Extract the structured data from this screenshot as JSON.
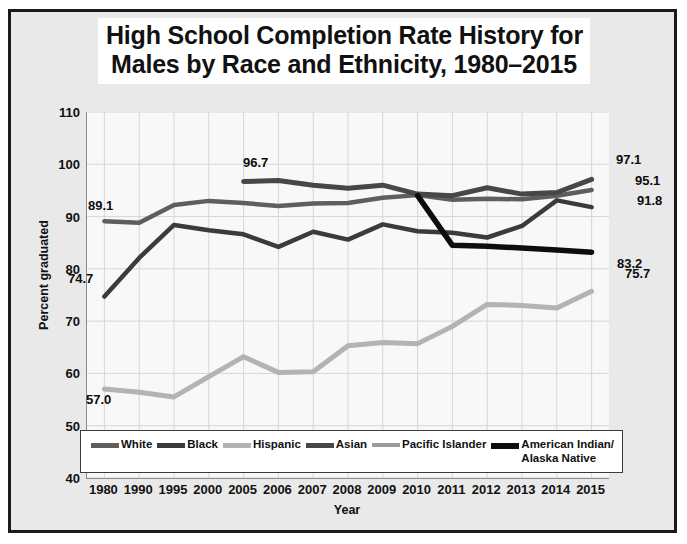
{
  "title": {
    "line1": "High School Completion Rate History for",
    "line2": "Males by Race and Ethnicity, 1980–2015"
  },
  "axes": {
    "ylabel": "Percent graduated",
    "xlabel": "Year",
    "yticks": [
      "110",
      "100",
      "90",
      "80",
      "70",
      "60",
      "50",
      "40"
    ],
    "ylim_min": 40,
    "ylim_max": 110
  },
  "colors": {
    "white_series": "#5e5e5e",
    "black_series": "#3b3b3b",
    "hispanic_series": "#b3b3b3",
    "asian_series": "#474747",
    "pacific_islander_series": "#9c9c9c",
    "american_indian_series": "#0d0d0d",
    "frame": "#1a1a1a",
    "canvas": "#e9e9e9",
    "plot_bg": "#f8f8f8",
    "grid": "#d6d6d6"
  },
  "legend": {
    "items": [
      {
        "label": "White",
        "label2": ""
      },
      {
        "label": "Black",
        "label2": ""
      },
      {
        "label": "Hispanic",
        "label2": ""
      },
      {
        "label": "Asian",
        "label2": ""
      },
      {
        "label": "Pacific Islander",
        "label2": ""
      },
      {
        "label": "American Indian/",
        "label2": "Alaska Native"
      }
    ]
  },
  "annotations": [
    {
      "text": "89.1",
      "x": 88,
      "y": 198
    },
    {
      "text": "74.7",
      "x": 68,
      "y": 271
    },
    {
      "text": "57.0",
      "x": 86,
      "y": 392
    },
    {
      "text": "96.7",
      "x": 243,
      "y": 155
    },
    {
      "text": "97.1",
      "x": 616,
      "y": 152
    },
    {
      "text": "95.1",
      "x": 635,
      "y": 173
    },
    {
      "text": "91.8",
      "x": 637,
      "y": 193
    },
    {
      "text": "83.2",
      "x": 617,
      "y": 256
    },
    {
      "text": "75.7",
      "x": 625,
      "y": 266
    }
  ],
  "chart_data": {
    "type": "line",
    "title": "High School Completion Rate History for Males by Race and Ethnicity, 1980–2015",
    "xlabel": "Year",
    "ylabel": "Percent graduated",
    "ylim": [
      40,
      110
    ],
    "grid": true,
    "legend_position": "inside-bottom",
    "categories": [
      "1980",
      "1990",
      "1995",
      "2000",
      "2005",
      "2006",
      "2007",
      "2008",
      "2009",
      "2010",
      "2011",
      "2012",
      "2013",
      "2014",
      "2015"
    ],
    "series": [
      {
        "name": "White",
        "color": "#5e5e5e",
        "values": [
          89.1,
          88.8,
          92.2,
          93.0,
          92.6,
          92.0,
          92.5,
          92.6,
          93.6,
          94.1,
          93.2,
          93.4,
          93.3,
          94.0,
          95.1
        ]
      },
      {
        "name": "Black",
        "color": "#3b3b3b",
        "values": [
          74.7,
          82.1,
          88.4,
          87.4,
          86.6,
          84.2,
          87.1,
          85.6,
          88.5,
          87.2,
          86.9,
          86.0,
          88.2,
          93.1,
          91.8
        ]
      },
      {
        "name": "Hispanic",
        "color": "#b3b3b3",
        "values": [
          57.0,
          56.4,
          55.5,
          59.4,
          63.2,
          60.2,
          60.3,
          65.3,
          65.9,
          65.7,
          69.0,
          73.2,
          73.0,
          72.5,
          75.7
        ]
      },
      {
        "name": "Asian",
        "color": "#474747",
        "values": [
          null,
          null,
          null,
          null,
          96.7,
          96.9,
          96.0,
          95.4,
          96.0,
          94.3,
          94.0,
          95.5,
          94.3,
          94.6,
          97.1
        ]
      },
      {
        "name": "Pacific Islander",
        "color": "#9c9c9c",
        "values": [
          null,
          null,
          null,
          null,
          null,
          null,
          null,
          null,
          null,
          null,
          null,
          null,
          null,
          null,
          null
        ]
      },
      {
        "name": "American Indian/Alaska Native",
        "color": "#0d0d0d",
        "values": [
          null,
          null,
          null,
          null,
          null,
          null,
          null,
          null,
          null,
          94.0,
          84.5,
          84.3,
          84.0,
          83.6,
          83.2
        ]
      }
    ],
    "labeled_points": [
      {
        "series": "White",
        "category": "1980",
        "value": 89.1
      },
      {
        "series": "White",
        "category": "2015",
        "value": 95.1
      },
      {
        "series": "Black",
        "category": "1980",
        "value": 74.7
      },
      {
        "series": "Black",
        "category": "2015",
        "value": 91.8
      },
      {
        "series": "Hispanic",
        "category": "1980",
        "value": 57.0
      },
      {
        "series": "Hispanic",
        "category": "2015",
        "value": 75.7
      },
      {
        "series": "Asian",
        "category": "2005",
        "value": 96.7
      },
      {
        "series": "Asian",
        "category": "2015",
        "value": 97.1
      },
      {
        "series": "American Indian/Alaska Native",
        "category": "2015",
        "value": 83.2
      }
    ]
  }
}
